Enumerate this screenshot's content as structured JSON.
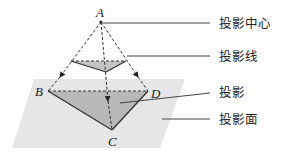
{
  "diagram": {
    "points": {
      "A": {
        "label": "A",
        "x": 101,
        "y": 22
      },
      "B": {
        "label": "B",
        "x": 48,
        "y": 91
      },
      "C": {
        "label": "C",
        "x": 112,
        "y": 130
      },
      "D": {
        "label": "D",
        "x": 148,
        "y": 91
      }
    },
    "callouts": [
      {
        "id": "projection-center",
        "label": "投影中心"
      },
      {
        "id": "projection-line",
        "label": "投影线"
      },
      {
        "id": "projection",
        "label": "投影"
      },
      {
        "id": "projection-plane",
        "label": "投影面"
      }
    ],
    "colors": {
      "plane": "#e6e6e6",
      "shadow": "#b8b8b8",
      "object": "#c4c4c4",
      "line": "#333333"
    }
  }
}
